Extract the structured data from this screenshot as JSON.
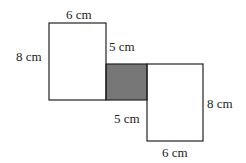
{
  "diagram": {
    "shapes": [
      {
        "name": "left-rectangle",
        "width_label": "6 cm",
        "height_label": "8 cm"
      },
      {
        "name": "shaded-overlap",
        "fill": "#777777"
      },
      {
        "name": "right-rectangle",
        "width_label": "6 cm",
        "height_label": "8 cm"
      }
    ],
    "labels": {
      "top_width": "6 cm",
      "left_height": "8 cm",
      "upper_inner_side": "5 cm",
      "lower_inner_side": "5 cm",
      "right_height": "8 cm",
      "bottom_width": "6 cm"
    },
    "stroke_color": "#222222",
    "shade_color": "#777777"
  }
}
